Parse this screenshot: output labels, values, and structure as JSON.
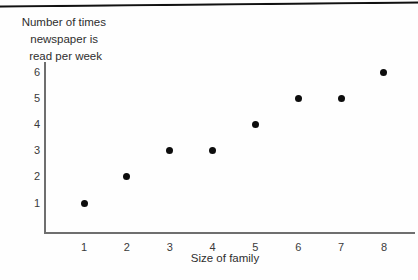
{
  "chart_data": {
    "type": "scatter",
    "title": "",
    "xlabel": "Size of family",
    "ylabel": "Number of times newspaper is read per week",
    "ylabel_lines": [
      "Number of times",
      "newspaper is",
      "read per week"
    ],
    "x": [
      1,
      2,
      3,
      4,
      5,
      6,
      7,
      8
    ],
    "values": [
      1,
      2,
      3,
      3,
      4,
      5,
      5,
      6
    ],
    "points": [
      {
        "x": 1,
        "y": 1
      },
      {
        "x": 2,
        "y": 2
      },
      {
        "x": 3,
        "y": 3
      },
      {
        "x": 4,
        "y": 3
      },
      {
        "x": 5,
        "y": 4
      },
      {
        "x": 6,
        "y": 5
      },
      {
        "x": 7,
        "y": 5
      },
      {
        "x": 8,
        "y": 6
      }
    ],
    "xticks": [
      "1",
      "2",
      "3",
      "4",
      "5",
      "6",
      "7",
      "8"
    ],
    "yticks": [
      "1",
      "2",
      "3",
      "4",
      "5",
      "6"
    ],
    "xlim": [
      0,
      8.7
    ],
    "ylim": [
      0,
      6.6
    ],
    "grid": false,
    "legend": null,
    "marker_color": "#0d0d0d",
    "axis_color": "#6f6f6f"
  },
  "figure": {
    "background_color": "#fefefe",
    "top_rule_color": "#111111"
  }
}
